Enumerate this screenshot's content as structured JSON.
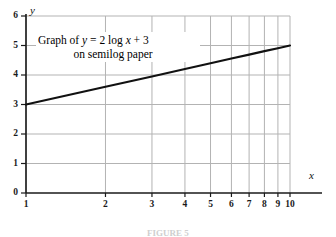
{
  "figure": {
    "annotation_line1": "Graph of y = 2 log x + 3",
    "annotation_line2": "on semilog paper",
    "caption": "FIGURE 5"
  },
  "axes": {
    "x_axis_label": "x",
    "y_axis_label": "y",
    "x_tick_labels": [
      "1",
      "2",
      "3",
      "4",
      "5",
      "6",
      "7",
      "8",
      "9",
      "10"
    ],
    "y_tick_labels": [
      "0",
      "1",
      "2",
      "3",
      "4",
      "5",
      "6"
    ]
  },
  "chart_data": {
    "type": "line",
    "title": "Graph of y = 2 log x + 3 on semilog paper",
    "xlabel": "x",
    "ylabel": "y",
    "xscale": "log",
    "yscale": "linear",
    "xlim": [
      1,
      10
    ],
    "ylim": [
      0,
      6
    ],
    "grid": true,
    "legend": null,
    "annotations": [
      {
        "text": "Graph of y = 2 log x + 3 on semilog paper",
        "x": 1.6,
        "y": 5.2
      }
    ],
    "x_ticks": [
      1,
      2,
      3,
      4,
      5,
      6,
      7,
      8,
      9,
      10
    ],
    "y_ticks": [
      0,
      1,
      2,
      3,
      4,
      5,
      6
    ],
    "series": [
      {
        "name": "y = 2 log x + 3",
        "color": "#111111",
        "x": [
          1,
          2,
          3,
          4,
          5,
          6,
          7,
          8,
          9,
          10
        ],
        "values": [
          3.0,
          3.6,
          3.95,
          4.2,
          4.4,
          4.56,
          4.69,
          4.81,
          4.91,
          5.0
        ]
      }
    ]
  },
  "style": {
    "grid_color": "#b3b3b3",
    "axis_color": "#1a1a1a",
    "line_color": "#111111",
    "background": "#ffffff"
  }
}
